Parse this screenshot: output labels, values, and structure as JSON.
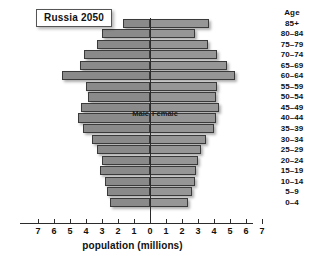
{
  "chart_data": {
    "type": "bar",
    "subtype": "population-pyramid",
    "title": "Russia 2050",
    "xlabel": "population (millions)",
    "ylabel": "Age",
    "grid": false,
    "legend_position": "inline-center",
    "legend": [
      "Male",
      "Female"
    ],
    "xlim": [
      -7,
      7
    ],
    "xticks": [
      7,
      6,
      5,
      4,
      3,
      2,
      1,
      0,
      1,
      2,
      3,
      4,
      5,
      6,
      7
    ],
    "xtick_values": [
      -7,
      -6,
      -5,
      -4,
      -3,
      -2,
      -1,
      0,
      1,
      2,
      3,
      4,
      5,
      6,
      7
    ],
    "categories": [
      "85+",
      "80-84",
      "75-79",
      "70-74",
      "65-69",
      "60-64",
      "55-59",
      "50-54",
      "45-49",
      "40-44",
      "35-39",
      "30-34",
      "25-29",
      "20-24",
      "15-19",
      "10-14",
      "5-9",
      "0-4"
    ],
    "series": [
      {
        "name": "Male",
        "side": "left",
        "values": [
          1.7,
          3.0,
          3.3,
          4.1,
          4.4,
          5.5,
          4.0,
          3.9,
          4.3,
          4.5,
          4.2,
          3.6,
          3.3,
          3.0,
          3.1,
          2.8,
          2.7,
          2.5
        ]
      },
      {
        "name": "Female",
        "side": "right",
        "values": [
          3.7,
          2.8,
          3.6,
          4.2,
          4.8,
          5.3,
          4.2,
          4.1,
          4.3,
          4.1,
          4.0,
          3.5,
          3.2,
          3.0,
          2.9,
          2.8,
          2.6,
          2.4
        ]
      }
    ]
  },
  "colors": {
    "bar_male": "#8a8a8a",
    "bar_female": "#969696",
    "bar_outline": "#3a3a3a",
    "axis": "#2b2b2b",
    "text": "#111111",
    "background": "#ffffff"
  }
}
